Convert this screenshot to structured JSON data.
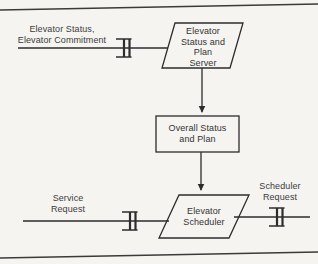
{
  "diagram": {
    "type": "data-flow-task-diagram",
    "colors": {
      "paper": "#f5f4f1",
      "ink": "#2d2d2d",
      "text": "#3c3c3c"
    },
    "tasks": [
      {
        "id": "status-plan-server",
        "shape": "parallelogram",
        "label": "Elevator\nStatus and\nPlan\nServer"
      },
      {
        "id": "elevator-scheduler",
        "shape": "parallelogram",
        "label": "Elevator\nScheduler"
      }
    ],
    "store": {
      "id": "overall-status-plan",
      "shape": "rectangle",
      "label": "Overall Status\nand Plan"
    },
    "flows": [
      {
        "id": "elevator-status-commitment",
        "label": "Elevator Status,\nElevator Commitment",
        "connector": "message-queue"
      },
      {
        "id": "service-request",
        "label": "Service\nRequest",
        "connector": "message-queue"
      },
      {
        "id": "scheduler-request",
        "label": "Scheduler\nRequest",
        "connector": "message-queue"
      }
    ]
  }
}
